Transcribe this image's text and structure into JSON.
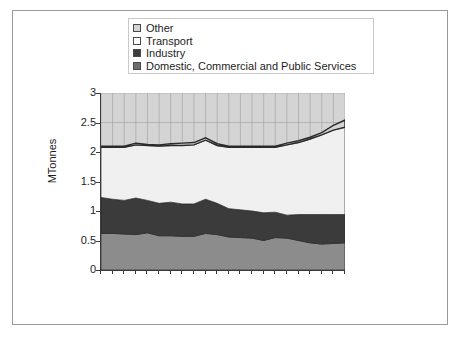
{
  "chart_data": {
    "type": "area",
    "stacked": true,
    "title": "",
    "xlabel": "",
    "ylabel": "MTonnes",
    "ylim": [
      0,
      3
    ],
    "yticks": [
      "0",
      "0.5",
      "1",
      "1.5",
      "2",
      "2.5",
      "3"
    ],
    "ytick_values": [
      0,
      0.5,
      1,
      1.5,
      2,
      2.5,
      3
    ],
    "grid": "vertical-and-horizontal",
    "legend_position": "top",
    "x": [
      1970,
      1971,
      1972,
      1973,
      1974,
      1975,
      1976,
      1977,
      1978,
      1979,
      1980,
      1981,
      1982,
      1983,
      1984,
      1985,
      1986,
      1987,
      1988,
      1989,
      1990,
      1991
    ],
    "xtick_labels": [
      "1970",
      "1972",
      "1974",
      "1976",
      "1978",
      "1980",
      "1982",
      "1984",
      "1986",
      "1988",
      "1990"
    ],
    "xtick_label_step": 2,
    "series": [
      {
        "name": "Domestic,  Commercial and Public Services",
        "color": "#8c8c8c",
        "values": [
          0.62,
          0.62,
          0.61,
          0.6,
          0.63,
          0.58,
          0.58,
          0.57,
          0.57,
          0.62,
          0.6,
          0.56,
          0.55,
          0.54,
          0.5,
          0.55,
          0.54,
          0.5,
          0.46,
          0.44,
          0.45,
          0.46
        ]
      },
      {
        "name": "Industry",
        "color": "#3b3b3b",
        "values": [
          0.61,
          0.58,
          0.57,
          0.62,
          0.55,
          0.55,
          0.57,
          0.55,
          0.55,
          0.58,
          0.53,
          0.48,
          0.47,
          0.46,
          0.47,
          0.43,
          0.39,
          0.44,
          0.48,
          0.5,
          0.49,
          0.48
        ]
      },
      {
        "name": "Transport",
        "color": "#f0f0f0",
        "values": [
          0.85,
          0.88,
          0.9,
          0.9,
          0.93,
          0.97,
          0.96,
          0.99,
          1.0,
          1.0,
          0.98,
          1.04,
          1.06,
          1.08,
          1.11,
          1.1,
          1.19,
          1.22,
          1.28,
          1.35,
          1.43,
          1.48
        ]
      },
      {
        "name": "Other",
        "color": "#d4d4d4",
        "values": [
          0.02,
          0.02,
          0.02,
          0.03,
          0.02,
          0.02,
          0.03,
          0.04,
          0.04,
          0.04,
          0.03,
          0.02,
          0.02,
          0.02,
          0.02,
          0.02,
          0.03,
          0.03,
          0.03,
          0.04,
          0.08,
          0.12
        ]
      }
    ],
    "totals": [
      2.1,
      2.1,
      2.1,
      2.15,
      2.13,
      2.12,
      2.14,
      2.15,
      2.16,
      2.24,
      2.14,
      2.1,
      2.1,
      2.1,
      2.1,
      2.1,
      2.15,
      2.19,
      2.25,
      2.33,
      2.45,
      2.54
    ],
    "background_color": "#d4d4d4",
    "fill_to_top": true
  },
  "legend": {
    "items": [
      {
        "label": "Other",
        "swatch_color": "#d4d4d4"
      },
      {
        "label": "Transport",
        "swatch_color": "#ffffff"
      },
      {
        "label": "Industry",
        "swatch_color": "#3b3b3b"
      },
      {
        "label": "Domestic,  Commercial and Public Services",
        "swatch_color": "#6e6e6e"
      }
    ]
  }
}
